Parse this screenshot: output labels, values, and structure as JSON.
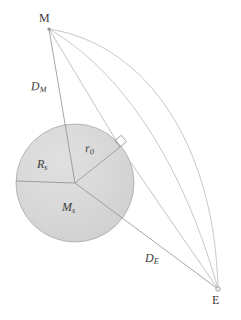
{
  "figure": {
    "background_color": "#ffffff",
    "line_color": "#9a9a9a",
    "text_color": "#3b3b3b",
    "sphere_fill_color": "#d6d6d6",
    "sphere_stroke_color": "#9a9a9a"
  },
  "points": [
    {
      "id": "M",
      "label": "M",
      "x": 49,
      "y": 29,
      "marker": "dot"
    },
    {
      "id": "E",
      "label": "E",
      "x": 218,
      "y": 289,
      "marker": "circle"
    },
    {
      "id": "S",
      "label": "",
      "x": 75,
      "y": 183,
      "marker": "none"
    },
    {
      "id": "T",
      "label": "",
      "x": 120,
      "y": 147,
      "marker": "none"
    }
  ],
  "sphere": {
    "name": "sun-disk",
    "center_x": 75,
    "center_y": 183,
    "radius": 59,
    "mass_label": "M",
    "mass_label_sub": "s",
    "radius_label": "R",
    "radius_label_sub": "s"
  },
  "labels": {
    "point_m": "M",
    "point_e": "E",
    "distance_m": "D",
    "distance_m_sub": "M",
    "distance_e": "D",
    "distance_e_sub": "E",
    "radius_s": "R",
    "radius_s_sub": "s",
    "impact_parameter": "r",
    "impact_parameter_sub": "0",
    "mass_s": "M",
    "mass_s_sub": "s"
  },
  "segments": [
    {
      "name": "segment-DM",
      "from": "M",
      "to": "S",
      "style": "solid",
      "label": "D_M"
    },
    {
      "name": "segment-DE",
      "from": "S",
      "to": "E",
      "style": "solid",
      "label": "D_E"
    },
    {
      "name": "segment-r0",
      "from": "S",
      "to": "T",
      "style": "solid",
      "label": "r_0"
    },
    {
      "name": "segment-light-ray",
      "from": "M",
      "to": "E",
      "style": "solid-bent",
      "label": ""
    },
    {
      "name": "segment-Rs-radius",
      "from": "S",
      "to": "left-edge",
      "style": "solid",
      "label": "R_s"
    }
  ],
  "arcs": [
    {
      "name": "arc-outer-path",
      "from": "M",
      "to": "E",
      "curvature": "bulging-right"
    },
    {
      "name": "arc-inner-path",
      "from": "M",
      "to": "E",
      "curvature": "slight-bulge"
    }
  ],
  "markers": {
    "right_angle": {
      "name": "right-angle-marker",
      "x": 120,
      "y": 147,
      "size": 8,
      "description": "perpendicular between r0 and light ray"
    }
  }
}
